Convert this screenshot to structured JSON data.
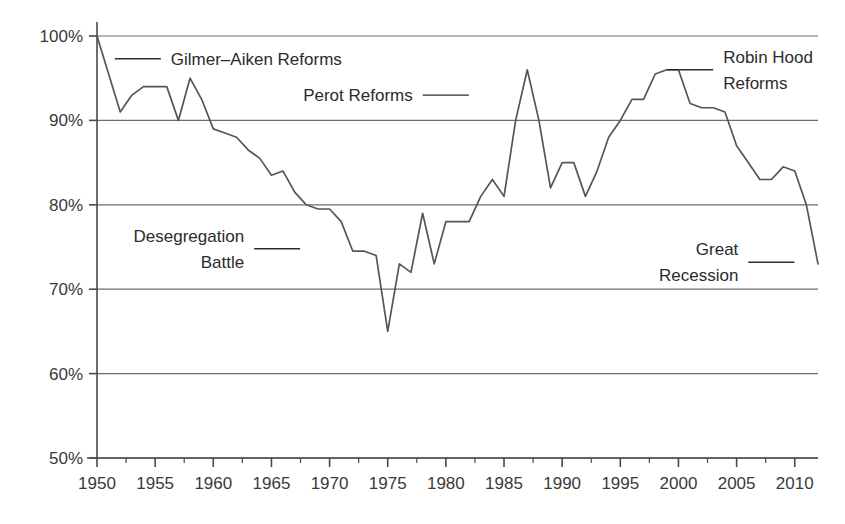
{
  "chart_data": {
    "type": "line",
    "title": "",
    "subtitle": "",
    "xlabel": "",
    "ylabel": "",
    "xlim": [
      1950,
      2012
    ],
    "ylim": [
      50,
      100
    ],
    "grid": true,
    "grid_axis": "y",
    "legend": "none",
    "y_tick_labels": [
      "50%",
      "60%",
      "70%",
      "80%",
      "90%",
      "100%"
    ],
    "y_tick_values": [
      50,
      60,
      70,
      80,
      90,
      100
    ],
    "x_tick_labels": [
      "1950",
      "1955",
      "1960",
      "1965",
      "1970",
      "1975",
      "1980",
      "1985",
      "1990",
      "1995",
      "2000",
      "2005",
      "2010"
    ],
    "x_tick_values": [
      1950,
      1955,
      1960,
      1965,
      1970,
      1975,
      1980,
      1985,
      1990,
      1995,
      2000,
      2005,
      2010
    ],
    "x_minor_ticks": true,
    "series": [
      {
        "name": "share",
        "color": "#555555",
        "x": [
          1950,
          1951,
          1952,
          1953,
          1954,
          1955,
          1956,
          1957,
          1958,
          1959,
          1960,
          1961,
          1962,
          1963,
          1964,
          1965,
          1966,
          1967,
          1968,
          1969,
          1970,
          1971,
          1972,
          1973,
          1974,
          1975,
          1976,
          1977,
          1978,
          1979,
          1980,
          1981,
          1982,
          1983,
          1984,
          1985,
          1986,
          1987,
          1988,
          1989,
          1990,
          1991,
          1992,
          1993,
          1994,
          1995,
          1996,
          1997,
          1998,
          1999,
          2000,
          2001,
          2002,
          2003,
          2004,
          2005,
          2006,
          2007,
          2008,
          2009,
          2010,
          2011,
          2012
        ],
        "y": [
          100.0,
          95.5,
          91.0,
          93.0,
          94.0,
          94.0,
          94.0,
          90.0,
          95.0,
          92.5,
          89.0,
          88.5,
          88.0,
          86.5,
          85.5,
          83.5,
          84.0,
          81.5,
          80.0,
          79.5,
          79.5,
          78.0,
          74.5,
          74.5,
          74.0,
          65.0,
          73.0,
          72.0,
          79.0,
          73.0,
          78.0,
          78.0,
          78.0,
          81.0,
          83.0,
          81.0,
          90.0,
          96.0,
          90.0,
          82.0,
          85.0,
          85.0,
          81.0,
          84.0,
          88.0,
          90.0,
          92.5,
          92.5,
          95.5,
          96.0,
          96.0,
          92.0,
          91.5,
          91.5,
          91.0,
          87.0,
          85.0,
          83.0,
          83.0,
          84.5,
          84.0,
          80.0,
          73.0
        ]
      }
    ],
    "annotations": [
      {
        "id": "gilmer-aiken",
        "label_lines": [
          "Gilmer–Aiken Reforms"
        ],
        "align": "left",
        "x": 1950.5,
        "y": 97.3
      },
      {
        "id": "desegregation",
        "label_lines": [
          "Desegregation",
          "Battle"
        ],
        "align": "right",
        "x": 1968.5,
        "y": 74.8
      },
      {
        "id": "perot",
        "label_lines": [
          "Perot Reforms"
        ],
        "align": "right",
        "x": 1983.0,
        "y": 93.0
      },
      {
        "id": "robin-hood",
        "label_lines": [
          "Robin Hood",
          "Reforms"
        ],
        "align": "left",
        "x": 1998.0,
        "y": 96.0
      },
      {
        "id": "great-recession",
        "label_lines": [
          "Great",
          "Recession"
        ],
        "align": "right",
        "x": 2011.0,
        "y": 73.2
      }
    ]
  },
  "colors": {
    "line": "#555555",
    "grid": "#6d6d6d",
    "axis": "#4a4a4a",
    "text": "#2b2b2b",
    "background": "#ffffff"
  }
}
